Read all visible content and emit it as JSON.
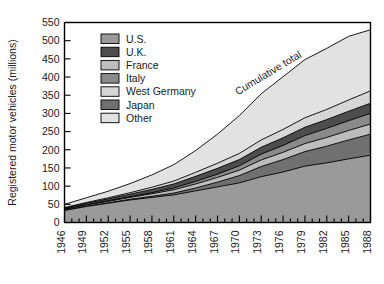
{
  "chart_data": {
    "type": "area",
    "title": "",
    "xlabel": "",
    "ylabel": "Registered motor vehicles (millions)",
    "ylim": [
      0,
      550
    ],
    "ytick_step": 50,
    "yticks": [
      0,
      50,
      100,
      150,
      200,
      250,
      300,
      350,
      400,
      450,
      500,
      550
    ],
    "xticks": [
      "1946",
      "1949",
      "1952",
      "1955",
      "1958",
      "1961",
      "1964",
      "1967",
      "1970",
      "1973",
      "1976",
      "1979",
      "1982",
      "1985",
      "1988"
    ],
    "xlim": [
      1946,
      1988
    ],
    "grid": false,
    "stacked": true,
    "legend_position": "upper-left-inside",
    "annotations": [
      {
        "text": "Cumulative total",
        "rotation": -31
      }
    ],
    "x": [
      1946,
      1949,
      1952,
      1955,
      1958,
      1961,
      1964,
      1967,
      1970,
      1973,
      1976,
      1979,
      1982,
      1985,
      1988
    ],
    "series": [
      {
        "name": "U.S.",
        "color": "#9a9a9a",
        "values": [
          33,
          44,
          53,
          62,
          69,
          76,
          87,
          98,
          109,
          126,
          139,
          155,
          164,
          175,
          185
        ]
      },
      {
        "name": "Japan",
        "color": "#707070",
        "values": [
          1,
          1,
          1,
          2,
          3,
          5,
          8,
          13,
          20,
          28,
          34,
          40,
          46,
          52,
          58
        ]
      },
      {
        "name": "France",
        "color": "#bdbdbd",
        "values": [
          2,
          3,
          4,
          5,
          7,
          9,
          11,
          13,
          15,
          18,
          20,
          22,
          24,
          26,
          28
        ]
      },
      {
        "name": "Italy",
        "color": "#8a8a8a",
        "values": [
          1,
          1,
          2,
          2,
          3,
          5,
          7,
          9,
          12,
          16,
          19,
          22,
          25,
          27,
          29
        ]
      },
      {
        "name": "U.K.",
        "color": "#4d4d4d",
        "values": [
          3,
          4,
          5,
          7,
          9,
          11,
          14,
          16,
          17,
          19,
          21,
          23,
          24,
          26,
          28
        ]
      },
      {
        "name": "West Germany",
        "color": "#d6d6d6",
        "values": [
          1,
          2,
          3,
          4,
          6,
          8,
          11,
          14,
          17,
          20,
          23,
          26,
          28,
          31,
          34
        ]
      },
      {
        "name": "Other",
        "color": "#e2e2e2",
        "values": [
          9,
          13,
          18,
          25,
          34,
          45,
          60,
          80,
          104,
          127,
          145,
          160,
          168,
          175,
          168
        ]
      }
    ],
    "cumulative_total": [
      50,
      68,
      86,
      107,
      131,
      159,
      198,
      243,
      294,
      354,
      401,
      448,
      479,
      512,
      530
    ]
  },
  "legend": {
    "items": [
      {
        "label": "U.S.",
        "color": "#9a9a9a"
      },
      {
        "label": "U.K.",
        "color": "#4d4d4d"
      },
      {
        "label": "France",
        "color": "#bdbdbd"
      },
      {
        "label": "Italy",
        "color": "#8a8a8a"
      },
      {
        "label": "West Germany",
        "color": "#d6d6d6"
      },
      {
        "label": "Japan",
        "color": "#707070"
      },
      {
        "label": "Other",
        "color": "#e2e2e2"
      }
    ]
  }
}
